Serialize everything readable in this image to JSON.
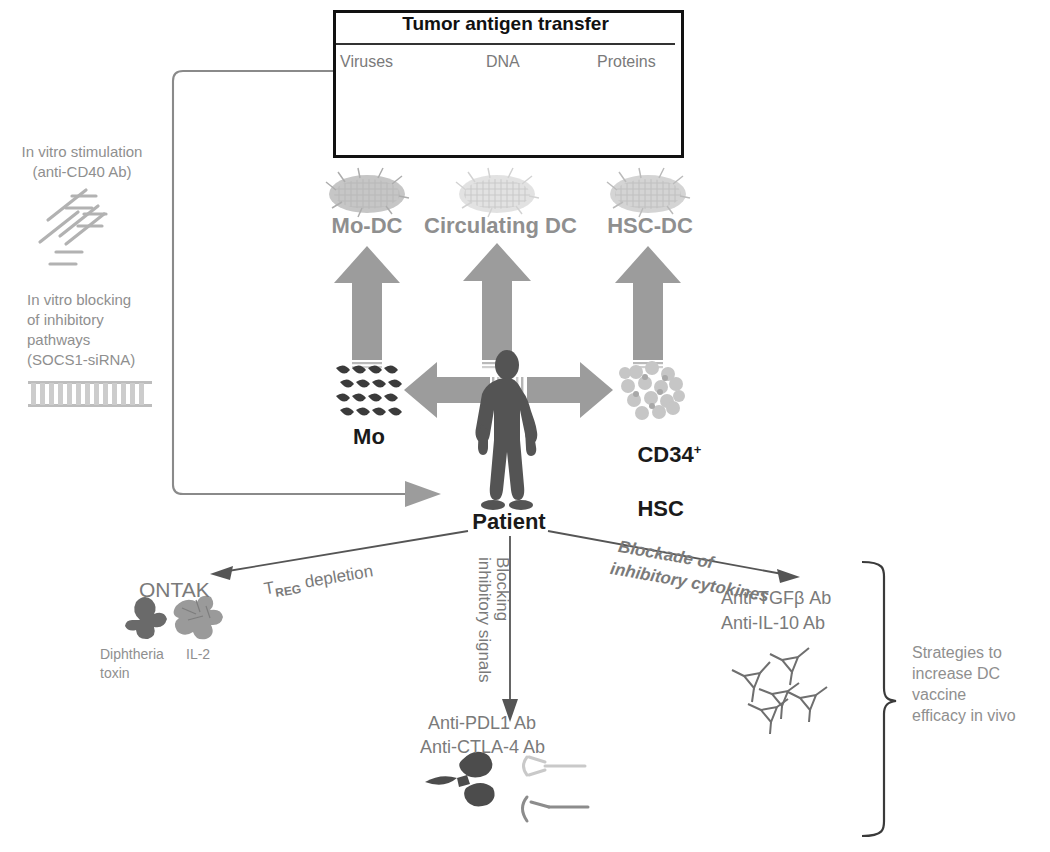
{
  "figure": {
    "type": "biomedical-schematic",
    "title_box": {
      "header": "Tumor antigen transfer",
      "columns": [
        {
          "label": "Viruses",
          "icon": "pentagon-virus-icon"
        },
        {
          "label": "DNA",
          "icon": "dna-helix-icon"
        },
        {
          "label": "Proteins",
          "icon": "protein-blobs-icon"
        }
      ]
    }
  },
  "left_panel": {
    "stimulation": {
      "line1": "In vitro stimulation",
      "line2": "(anti-CD40 Ab)",
      "icon": "antibody-cd40-icon"
    },
    "blocking": {
      "line1": "In vitro blocking",
      "line2": "of inhibitory",
      "line3": "pathways",
      "line4": "(SOCS1-siRNA)",
      "icon": "sirna-ladder-icon"
    }
  },
  "dc_row": {
    "items": [
      {
        "label": "Mo-DC",
        "icon": "dendritic-cell-cluster-icon"
      },
      {
        "label": "Circulating DC",
        "icon": "dendritic-cell-cluster-icon"
      },
      {
        "label": "HSC-DC",
        "icon": "dendritic-cell-cluster-icon"
      }
    ]
  },
  "source_row": {
    "monocytes": {
      "label": "Mo",
      "icon": "monocyte-cluster-icon"
    },
    "hsc": {
      "label_line1": "CD34",
      "label_sup": "+",
      "label_line2": "HSC",
      "icon": "hsc-cluster-icon"
    },
    "patient": {
      "label": "Patient",
      "icon": "patient-silhouette-icon"
    }
  },
  "strategies": {
    "treg": {
      "arrow_label_pre": "T",
      "arrow_label_sub": "REG",
      "arrow_label_post": " depletion",
      "drug": "ONTAK",
      "caption_left_line1": "Diphtheria",
      "caption_left_line2": "toxin",
      "caption_right": "IL-2",
      "icon": "ontak-fusion-protein-icon"
    },
    "checkpoint": {
      "arrow_label_line1": "Blocking",
      "arrow_label_line2": "inhibitory signals",
      "drug_line1": "Anti-PDL1 Ab",
      "drug_line2": "Anti-CTLA-4 Ab",
      "icon": "antibody-receptor-icon"
    },
    "cytokine": {
      "arrow_label_line1": "Blockade of",
      "arrow_label_line2": "inhibitory cytokines",
      "drug_line1": "Anti-TGFβ Ab",
      "drug_line2": "Anti-IL-10 Ab",
      "icon": "cytokine-trimer-icon"
    },
    "bracket_caption": {
      "line1": "Strategies to",
      "line2": "increase DC",
      "line3": "vaccine",
      "line4": "efficacy in vivo"
    }
  },
  "colors": {
    "arrow_gray": "#9c9c9c",
    "text_gray": "#8f8f8f",
    "patient_dark": "#545454",
    "box_border": "#111111",
    "line_gray": "#8a8a8a",
    "thin_line": "#555555"
  }
}
